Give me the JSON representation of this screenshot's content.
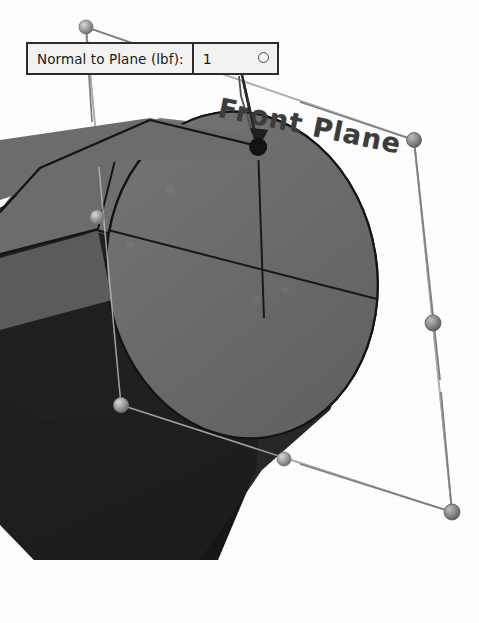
{
  "viewport": {
    "width": 479,
    "height": 623,
    "background_color": "#fdfdfd",
    "app_type": "cad-3d-viewport"
  },
  "callout": {
    "name": "normal-to-plane-force-callout",
    "label": "Normal to Plane (lbf):",
    "value": "1",
    "unit": "lbf",
    "handle_icon": "circle-handle-icon",
    "border_color": "#2b2b2b",
    "fill_color": "#f2f2f0",
    "text_color": "#1a1a1a"
  },
  "plane": {
    "name": "front-plane",
    "label": "Front Plane",
    "label_color": "#3c3c3c",
    "edge_color": "#8c8c8c",
    "handle_color": "#9a9a9a",
    "corner_handles": [
      {
        "name": "plane-handle-top-left",
        "x": 86,
        "y": 27
      },
      {
        "name": "plane-handle-top-right",
        "x": 414,
        "y": 140
      },
      {
        "name": "plane-handle-bottom-right",
        "x": 452,
        "y": 512
      },
      {
        "name": "plane-handle-bottom-left",
        "x": 121,
        "y": 405
      }
    ],
    "edge_handles": [
      {
        "name": "plane-handle-mid-left",
        "x": 97,
        "y": 217
      },
      {
        "name": "plane-handle-mid-bottom",
        "x": 284,
        "y": 459
      },
      {
        "name": "plane-handle-mid-right",
        "x": 433,
        "y": 323
      }
    ]
  },
  "normal_vector": {
    "name": "normal-vector-arrow",
    "origin_x": 258,
    "origin_y": 146,
    "tip_x": 240,
    "tip_y": 63,
    "color": "#2a2a2a",
    "anchor_node_label": "force-application-node"
  },
  "model": {
    "name": "cylinder-body",
    "face_top_color": "#6e6e6e",
    "face_side_color": "#565656",
    "face_dark_color": "#1c1c1c",
    "ellipse_face_color": "#6a6a6a",
    "edge_color": "#161616"
  },
  "leader": {
    "name": "callout-leader-line",
    "color": "#4a4a4a"
  }
}
